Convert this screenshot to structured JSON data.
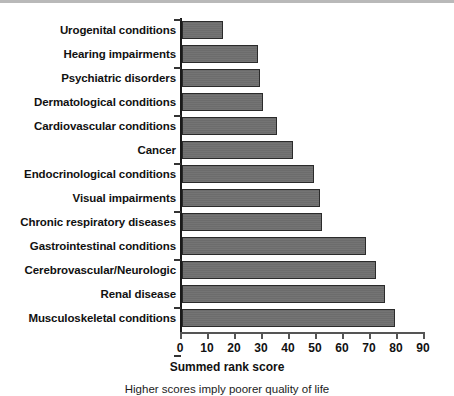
{
  "chart_data": {
    "type": "bar",
    "orientation": "horizontal",
    "title": "",
    "xlabel": "Summed rank score",
    "ylabel": "",
    "xlim": [
      0,
      90
    ],
    "xticks": [
      0,
      10,
      20,
      30,
      40,
      50,
      60,
      70,
      80,
      90
    ],
    "grid": false,
    "legend": null,
    "caption": "Higher scores imply poorer quality of life",
    "bar_color": "#6e6e6e",
    "bar_edge_color": "#2b2b2b",
    "categories": [
      "Urogenital conditions",
      "Hearing impairments",
      "Psychiatric disorders",
      "Dermatological conditions",
      "Cardiovascular conditions",
      "Cancer",
      "Endocrinological conditions",
      "Visual impairments",
      "Chronic respiratory diseases",
      "Gastrointestinal conditions",
      "Cerebrovascular/Neurologic",
      "Renal disease",
      "Musculoskeletal conditions"
    ],
    "values": [
      15,
      28,
      29,
      30,
      35,
      41,
      49,
      51,
      52,
      68,
      72,
      75,
      79
    ]
  }
}
